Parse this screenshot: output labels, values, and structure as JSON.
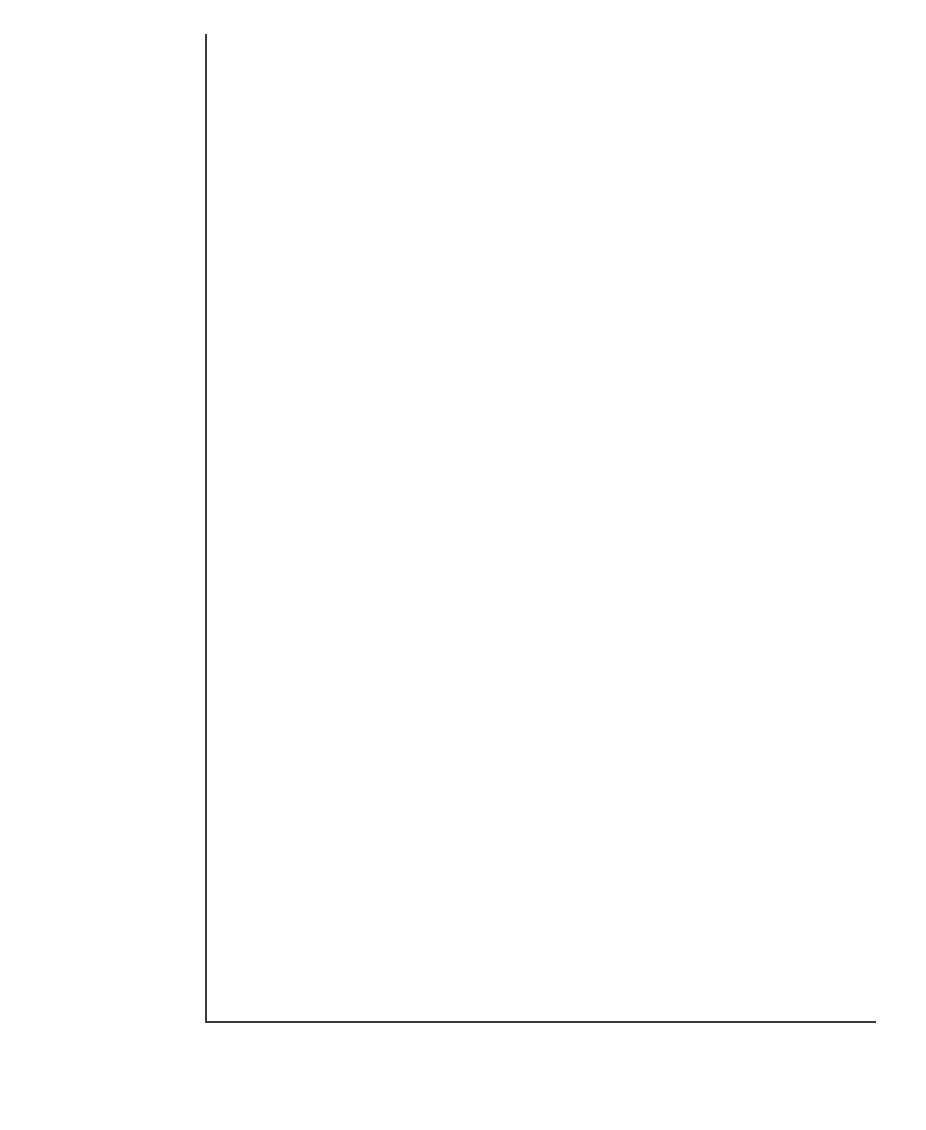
{
  "chart_data": {
    "type": "bar",
    "orientation": "horizontal",
    "title": "",
    "xlabel": "",
    "ylabel": "",
    "xlim": [
      0,
      90
    ],
    "xticks": [
      0,
      10,
      20,
      30,
      40,
      50,
      60,
      70,
      80,
      90
    ],
    "grid": false,
    "legend_position": "bottom",
    "series": [
      {
        "name": "1996 surveys",
        "color": "#eaeaea"
      },
      {
        "name": "2000 surveys",
        "color": "#c4c4c4"
      },
      {
        "name": "2004/05 surveys",
        "color": "#808080"
      }
    ],
    "categories": [
      "Average**",
      "Denmark*",
      "Finland*",
      "Switzerland",
      "Scotland",
      "Australia***",
      "Austria*",
      "Sweden*",
      "Belgium*",
      "Canada",
      "Netherlands*",
      "England and Wales*",
      "Northern Ireland",
      "Portugal*",
      "U.S.",
      "France*",
      "Poland",
      "Japan"
    ],
    "rows": [
      {
        "category": "Average**",
        "v1996": 61.5,
        "v2000": 62.0,
        "v2004": 63.0,
        "ci_low": null,
        "ci_high": null,
        "value_label": "63",
        "gap_after": true
      },
      {
        "category": "Denmark*",
        "v1996": 77.0,
        "v2000": 77.0,
        "v2004": 75.8,
        "ci_low": 73.6,
        "ci_high": 78.1,
        "value_label": ""
      },
      {
        "category": "Finland*",
        "v1996": 72.5,
        "v2000": 74.0,
        "v2004": 72.8,
        "ci_low": 68.5,
        "ci_high": 75.5,
        "value_label": ""
      },
      {
        "category": "Switzerland",
        "v1996": 68.5,
        "v2000": 70.0,
        "v2004": 71.5,
        "ci_low": 69.8,
        "ci_high": 73.4,
        "value_label": ""
      },
      {
        "category": "Scotland",
        "v1996": 70.5,
        "v2000": 71.5,
        "v2004": 70.2,
        "ci_low": 67.2,
        "ci_high": 72.5,
        "value_label": ""
      },
      {
        "category": "Australia***",
        "v1996": 70.0,
        "v2000": 70.8,
        "v2004": 69.2,
        "ci_low": 67.8,
        "ci_high": 70.8,
        "value_label": ""
      },
      {
        "category": "Austria*",
        "v1996": 53.0,
        "v2000": 66.0,
        "v2004": 67.7,
        "ci_low": 64.3,
        "ci_high": 71.0,
        "value_label": ""
      },
      {
        "category": "Sweden*",
        "v1996": 71.0,
        "v2000": 69.5,
        "v2004": 66.8,
        "ci_low": 64.0,
        "ci_high": 68.5,
        "value_label": ""
      },
      {
        "category": "Belgium*",
        "v1996": 62.0,
        "v2000": 62.5,
        "v2004": 65.3,
        "ci_low": 62.5,
        "ci_high": 67.0,
        "value_label": ""
      },
      {
        "category": "Canada",
        "v1996": 70.0,
        "v2000": 70.8,
        "v2004": 65.0,
        "ci_low": 61.8,
        "ci_high": 67.2,
        "value_label": ""
      },
      {
        "category": "Netherlands*",
        "v1996": 70.0,
        "v2000": 69.5,
        "v2004": 61.5,
        "ci_low": 59.5,
        "ci_high": 64.0,
        "value_label": ""
      },
      {
        "category": "England and Wales*",
        "v1996": 68.5,
        "v2000": 65.5,
        "v2004": 61.2,
        "ci_low": 59.0,
        "ci_high": 63.5,
        "value_label": ""
      },
      {
        "category": "Northern Ireland",
        "v1996": 66.5,
        "v2000": 69.0,
        "v2004": 61.0,
        "ci_low": 57.8,
        "ci_high": 63.8,
        "value_label": ""
      },
      {
        "category": "Portugal*",
        "v1996": 31.5,
        "v2000": 31.5,
        "v2004": 58.2,
        "ci_low": 55.7,
        "ci_high": 60.5,
        "value_label": ""
      },
      {
        "category": "U.S.",
        "v1996": 65.5,
        "v2000": 65.5,
        "v2004": 56.8,
        "ci_low": 52.5,
        "ci_high": 60.8,
        "value_label": ""
      },
      {
        "category": "France*",
        "v1996": 47.5,
        "v2000": 57.5,
        "v2004": 53.0,
        "ci_low": 47.8,
        "ci_high": 58.0,
        "value_label": ""
      },
      {
        "category": "Poland",
        "v1996": 34.5,
        "v2000": 39.5,
        "v2004": 46.4,
        "ci_low": 43.0,
        "ci_high": 50.0,
        "value_label": ""
      },
      {
        "category": "Japan",
        "v1996": 44.0,
        "v2000": 44.5,
        "v2004": 44.0,
        "ci_low": 37.2,
        "ci_high": 51.0,
        "value_label": ""
      }
    ]
  },
  "legend": {
    "items": [
      {
        "label": "1996 surveys",
        "color": "#eaeaea"
      },
      {
        "label": "2000 surveys",
        "color": "#c4c4c4"
      },
      {
        "label": "2004/05 surveys",
        "color": "#808080"
      }
    ]
  },
  "axis": {
    "ticks": [
      "0",
      "10",
      "20",
      "30",
      "40",
      "50",
      "60",
      "70",
      "80",
      "90"
    ]
  }
}
